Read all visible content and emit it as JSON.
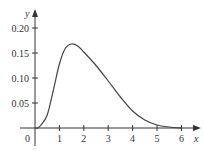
{
  "chart_data": {
    "type": "line",
    "title": "",
    "xlabel": "x",
    "ylabel": "y",
    "xlim": [
      0,
      6.5
    ],
    "ylim": [
      0,
      0.22
    ],
    "grid": false,
    "x_ticks": [
      1,
      2,
      3,
      4,
      5,
      6
    ],
    "x_tick_labels": [
      "1",
      "2",
      "3",
      "4",
      "5",
      "6"
    ],
    "y_ticks": [
      0.05,
      0.1,
      0.15,
      0.2
    ],
    "y_tick_labels": [
      "0.05",
      "0.10",
      "0.15",
      "0.20"
    ],
    "origin_label": "0",
    "series": [
      {
        "name": "f(x)",
        "x": [
          0,
          0.1,
          0.25,
          0.5,
          0.75,
          1.0,
          1.25,
          1.5,
          1.75,
          2.0,
          2.5,
          3.0,
          3.5,
          4.0,
          4.5,
          5.0,
          5.5,
          6.0
        ],
        "y": [
          0,
          0.0,
          0.006,
          0.026,
          0.075,
          0.128,
          0.16,
          0.168,
          0.164,
          0.152,
          0.125,
          0.094,
          0.062,
          0.034,
          0.016,
          0.006,
          0.002,
          0.0
        ]
      }
    ]
  }
}
